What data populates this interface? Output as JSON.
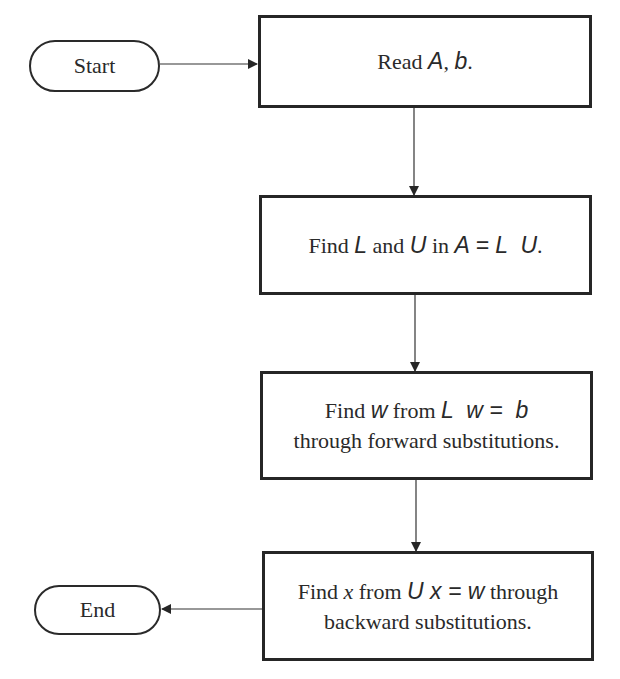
{
  "diagram": {
    "type": "flowchart",
    "colors": {
      "stroke": "#262626",
      "text": "#2a2a2a",
      "background": "#ffffff"
    },
    "nodes": {
      "start": {
        "shape": "terminal",
        "label": "Start"
      },
      "read": {
        "shape": "process",
        "line1": {
          "t1": "Read ",
          "m1": "A",
          "t2": ", ",
          "m2": "b",
          "t3": "."
        }
      },
      "decompose": {
        "shape": "process",
        "line1": {
          "t1": "Find ",
          "m1": "L",
          "t2": " and ",
          "m2": "U",
          "t3": " in ",
          "m3": "A = L  U",
          "t4": "."
        }
      },
      "forward": {
        "shape": "process",
        "line1": {
          "t1": "Find ",
          "m1": "w",
          "t2": " from ",
          "m2": "L  w =  b"
        },
        "line2": "through forward substitutions."
      },
      "backward": {
        "shape": "process",
        "line1": {
          "t1": "Find ",
          "m1": "x",
          "t2": " from ",
          "m2": "U x = w",
          "t3": " through"
        },
        "line2": "backward substitutions."
      },
      "end": {
        "shape": "terminal",
        "label": "End"
      }
    },
    "edges": [
      {
        "from": "start",
        "to": "read",
        "direction": "right"
      },
      {
        "from": "read",
        "to": "decompose",
        "direction": "down"
      },
      {
        "from": "decompose",
        "to": "forward",
        "direction": "down"
      },
      {
        "from": "forward",
        "to": "backward",
        "direction": "down"
      },
      {
        "from": "backward",
        "to": "end",
        "direction": "left"
      }
    ]
  }
}
